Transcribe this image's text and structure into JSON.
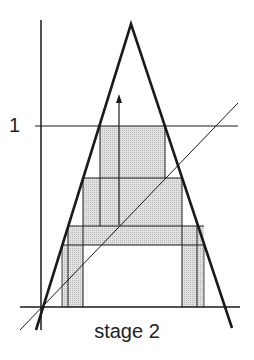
{
  "diagram": {
    "y_tick_label": "1",
    "caption": "stage 2",
    "colors": {
      "line": "#1a1a1a",
      "fill": "#d6d6d6",
      "background": "#ffffff"
    }
  }
}
